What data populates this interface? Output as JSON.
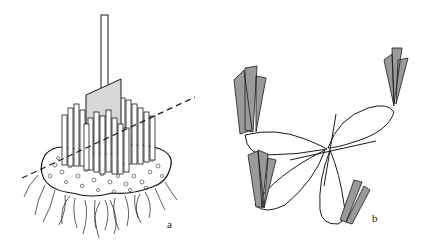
{
  "figure": {
    "panels": [
      {
        "id": "a",
        "label": "a",
        "depicts": "spade cutting vertically through a clump of stems with root ball; dashed cut line"
      },
      {
        "id": "b",
        "label": "b",
        "depicts": "divided clump pieces (four root sections with leaf fans) radiating from centre point"
      }
    ],
    "colors": {
      "background": "#ffffff",
      "ink": "#1a1a1a",
      "spade_fill": "#d8d8d8",
      "leaf_fill": "#9a9a9a"
    }
  }
}
